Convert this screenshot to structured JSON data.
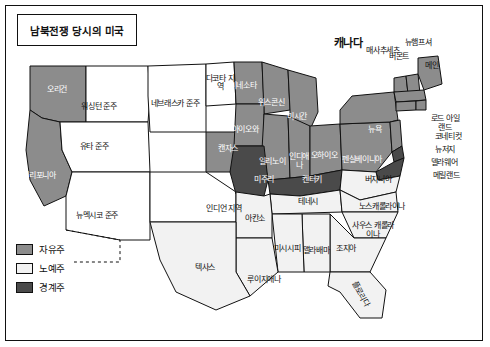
{
  "title": "남북전쟁 당시의 미국",
  "legend": {
    "items": [
      {
        "label": "자유주",
        "color": "#8c8c8c"
      },
      {
        "label": "노예주",
        "color": "#f2f2f2"
      },
      {
        "label": "경계주",
        "color": "#4a4a4a"
      }
    ]
  },
  "colors": {
    "free": "#8c8c8c",
    "slave": "#f2f2f2",
    "border_state": "#4a4a4a",
    "territory": "#ffffff",
    "outline": "#111111"
  },
  "map": {
    "country_label": "캐나다",
    "regions": [
      {
        "name": "오리건",
        "label": "오리건",
        "type": "free",
        "x": 56,
        "y": 92
      },
      {
        "name": "워싱턴-준주",
        "label": "워싱턴 준주",
        "type": "territory",
        "x": 98,
        "y": 108
      },
      {
        "name": "유타-준주",
        "label": "유타 준주",
        "type": "territory",
        "x": 93,
        "y": 148
      },
      {
        "name": "캘리포니아",
        "label": "캘리포니아",
        "type": "free",
        "x": 38,
        "y": 177
      },
      {
        "name": "뉴멕시코-준주",
        "label": "뉴멕시코 준주",
        "type": "territory",
        "x": 96,
        "y": 218
      },
      {
        "name": "네브래스카-준주",
        "label": "네브래스카 준주",
        "type": "territory",
        "x": 174,
        "y": 105
      },
      {
        "name": "미네소타",
        "label": "미네소타",
        "type": "free",
        "x": 243,
        "y": 88
      },
      {
        "name": "다코타-지역",
        "label": "다코타 지역",
        "type": "territory",
        "x": 219,
        "y": 84
      },
      {
        "name": "위스콘신",
        "label": "위스콘신",
        "type": "free",
        "x": 270,
        "y": 104
      },
      {
        "name": "아이오와",
        "label": "아이오와",
        "type": "free",
        "x": 245,
        "y": 131
      },
      {
        "name": "미시간",
        "label": "미시간",
        "type": "free",
        "x": 296,
        "y": 118
      },
      {
        "name": "일리노이",
        "label": "일리노이",
        "type": "free",
        "x": 271,
        "y": 163
      },
      {
        "name": "인디애나",
        "label": "인디애나",
        "type": "free",
        "x": 297,
        "y": 163
      },
      {
        "name": "오하이오",
        "label": "오하이오",
        "type": "free",
        "x": 322,
        "y": 157
      },
      {
        "name": "펜실베이니아",
        "label": "펜실베이니아",
        "type": "free",
        "x": 361,
        "y": 161
      },
      {
        "name": "뉴욕",
        "label": "뉴욕",
        "type": "free",
        "x": 374,
        "y": 131
      },
      {
        "name": "버몬트",
        "label": "버몬트",
        "type": "free",
        "x": 399,
        "y": 58
      },
      {
        "name": "메인",
        "label": "메인",
        "type": "free",
        "x": 432,
        "y": 67
      },
      {
        "name": "뉴햄프셔",
        "label": "뉴햄프셔",
        "type": "free",
        "x": 418,
        "y": 44
      },
      {
        "name": "매사추세츠",
        "label": "매사추세츠",
        "type": "free",
        "x": 383,
        "y": 52
      },
      {
        "name": "로드아일랜드",
        "label": "로드 아일랜드",
        "type": "free",
        "x": 444,
        "y": 122
      },
      {
        "name": "코네티컷",
        "label": "코네티컷",
        "type": "free",
        "x": 448,
        "y": 137
      },
      {
        "name": "뉴저지",
        "label": "뉴저지",
        "type": "free",
        "x": 444,
        "y": 150
      },
      {
        "name": "델라웨어",
        "label": "델라웨어",
        "type": "border",
        "x": 443,
        "y": 163
      },
      {
        "name": "메릴랜드",
        "label": "메릴랜드",
        "type": "border",
        "x": 445,
        "y": 176
      },
      {
        "name": "캔자스",
        "label": "캔자스",
        "type": "free",
        "x": 228,
        "y": 150
      },
      {
        "name": "미주리",
        "label": "미주리",
        "type": "border",
        "x": 264,
        "y": 180
      },
      {
        "name": "켄터키",
        "label": "켄터키",
        "type": "border",
        "x": 312,
        "y": 181
      },
      {
        "name": "버지니아",
        "label": "버지니아",
        "type": "slave",
        "x": 377,
        "y": 180
      },
      {
        "name": "테네시",
        "label": "테네시",
        "type": "slave",
        "x": 308,
        "y": 202
      },
      {
        "name": "노스캐롤라이나",
        "label": "노스캐롤라이나",
        "type": "slave",
        "x": 382,
        "y": 208
      },
      {
        "name": "사우스캐롤라이나",
        "label": "사우스 캐롤라이나",
        "type": "slave",
        "x": 372,
        "y": 228
      },
      {
        "name": "조지아",
        "label": "조지아",
        "type": "slave",
        "x": 345,
        "y": 249
      },
      {
        "name": "앨라배마",
        "label": "앨라배마",
        "type": "slave",
        "x": 315,
        "y": 252
      },
      {
        "name": "미시시피",
        "label": "미시시피",
        "type": "slave",
        "x": 286,
        "y": 250
      },
      {
        "name": "아칸소",
        "label": "아칸소",
        "type": "slave",
        "x": 255,
        "y": 219
      },
      {
        "name": "루이지애나",
        "label": "루이지애나",
        "type": "slave",
        "x": 263,
        "y": 280
      },
      {
        "name": "텍사스",
        "label": "텍사스",
        "type": "slave",
        "x": 205,
        "y": 268
      },
      {
        "name": "인디언-지역",
        "label": "인디언 지역",
        "type": "territory",
        "x": 223,
        "y": 210
      },
      {
        "name": "플로리다",
        "label": "플로리다",
        "type": "slave",
        "x": 360,
        "y": 300
      }
    ]
  }
}
